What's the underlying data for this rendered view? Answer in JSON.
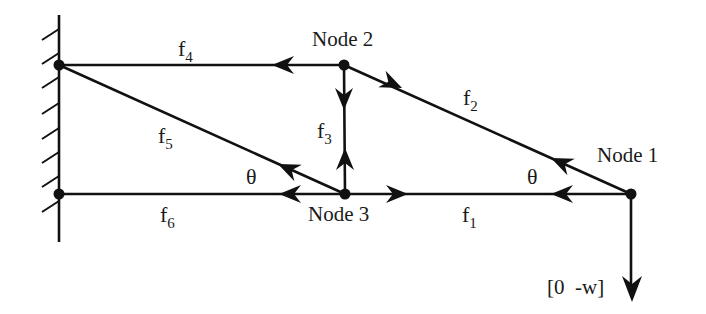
{
  "diagram": {
    "title": "",
    "nodes": [
      {
        "id": "node1",
        "label": "Node 1"
      },
      {
        "id": "node2",
        "label": "Node 2"
      },
      {
        "id": "node3",
        "label": "Node 3"
      }
    ],
    "members": [
      {
        "id": "f1",
        "base": "f",
        "sub": "1"
      },
      {
        "id": "f2",
        "base": "f",
        "sub": "2"
      },
      {
        "id": "f3",
        "base": "f",
        "sub": "3"
      },
      {
        "id": "f4",
        "base": "f",
        "sub": "4"
      },
      {
        "id": "f5",
        "base": "f",
        "sub": "5"
      },
      {
        "id": "f6",
        "base": "f",
        "sub": "6"
      }
    ],
    "angles": [
      {
        "id": "theta-left",
        "label": "θ"
      },
      {
        "id": "theta-right",
        "label": "θ"
      }
    ],
    "load": {
      "label": "[0  -w]"
    },
    "support": {
      "type": "fixed wall"
    },
    "colors": {
      "stroke": "#111111",
      "background": "#ffffff"
    }
  }
}
